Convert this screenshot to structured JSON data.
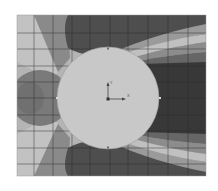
{
  "figure": {
    "colors": {
      "background": "#ffffff",
      "lightest": "#c4c4c4",
      "light": "#acacac",
      "mid": "#8e8e8e",
      "mid_dark": "#6f6f6f",
      "dark": "#4f4f4f",
      "darkest": "#383838",
      "cylinder": "#c8c8c8",
      "grid": "#2a2a2a"
    },
    "plot_area": {
      "x": 17,
      "y": 15,
      "width": 189,
      "height": 161
    },
    "cylinder": {
      "cx": 108,
      "cy": 98,
      "r": 51
    },
    "grid": {
      "vertical_x": [
        34,
        53,
        72,
        90,
        110,
        128,
        148,
        168,
        188
      ],
      "horizontal_y": [
        33,
        49,
        66,
        82,
        98,
        115,
        131,
        148,
        164
      ]
    },
    "coordinate_axes": {
      "origin": [
        108,
        99
      ],
      "x_label": "X",
      "y_label": "Y"
    }
  }
}
